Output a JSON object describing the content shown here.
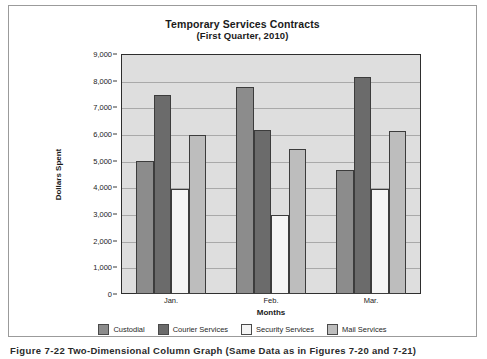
{
  "chart_data": {
    "type": "bar",
    "title": "Temporary Services Contracts",
    "subtitle": "(First Quarter, 2010)",
    "xlabel": "Months",
    "ylabel": "Dollars Spent",
    "categories": [
      "Jan.",
      "Feb.",
      "Mar."
    ],
    "series": [
      {
        "name": "Custodial",
        "values": [
          5000,
          7750,
          4650
        ],
        "color": "#8c8c8c"
      },
      {
        "name": "Courier Services",
        "values": [
          7450,
          6150,
          8150
        ],
        "color": "#6b6b6b"
      },
      {
        "name": "Security Services",
        "values": [
          3950,
          2950,
          3950
        ],
        "color": "#f4f4f4"
      },
      {
        "name": "Mail Services",
        "values": [
          5950,
          5450,
          6100
        ],
        "color": "#bdbdbd"
      }
    ],
    "ylim": [
      0,
      9000
    ],
    "ytick_labels": [
      "9,000",
      "8,000",
      "7,000",
      "6,000",
      "5,000",
      "4,000",
      "3,000",
      "2,000",
      "1,000",
      "0"
    ],
    "ytick_values": [
      9000,
      8000,
      7000,
      6000,
      5000,
      4000,
      3000,
      2000,
      1000,
      0
    ],
    "grid": true,
    "legend_position": "bottom",
    "plot_background": "#dedede",
    "plot_border_color": "#2e2e2e",
    "gridline_color": "#a9a9a9"
  },
  "caption": {
    "number": "Figure 7-22",
    "text": "Two-Dimensional Column Graph (Same Data as in Figures 7-20 and 7-21)"
  }
}
